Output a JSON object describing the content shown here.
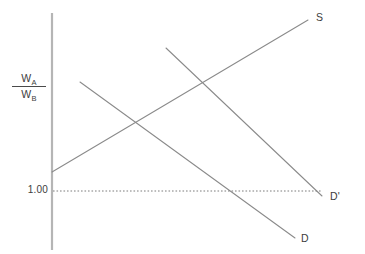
{
  "figure": {
    "type": "economics-supply-demand-diagram",
    "background_color": "#ffffff",
    "line_color": "#8a8a8a",
    "axis_color": "#b5b5b5",
    "text_color": "#3d3d3d"
  },
  "axes": {
    "y_axis": {
      "name": "relative-wage-axis",
      "label_numerator": "W",
      "label_numerator_sub": "A",
      "label_denominator": "W",
      "label_denominator_sub": "B",
      "x": 52,
      "y_top": 13,
      "y_bottom": 250
    },
    "ticks": [
      {
        "label": "1.00",
        "y": 191
      }
    ]
  },
  "reference_line": {
    "name": "unity-wage-ratio-line",
    "label": "1.00",
    "style": "dotted",
    "y": 191,
    "x_start": 53,
    "x_end": 322
  },
  "curves": [
    {
      "name": "supply-curve",
      "label": "S",
      "slope": "upward",
      "x1": 52,
      "y1": 172,
      "x2": 308,
      "y2": 20,
      "label_x": 316,
      "label_y": 11
    },
    {
      "name": "demand-curve",
      "label": "D",
      "slope": "downward",
      "x1": 80,
      "y1": 82,
      "x2": 295,
      "y2": 238,
      "label_x": 301,
      "label_y": 232
    },
    {
      "name": "demand-curve-shifted",
      "label": "D'",
      "slope": "downward",
      "x1": 166,
      "y1": 48,
      "x2": 322,
      "y2": 196,
      "label_x": 330,
      "label_y": 190
    }
  ],
  "intersections": [
    {
      "name": "equilibrium-initial",
      "curves": "S x D",
      "x": 137,
      "y": 123
    },
    {
      "name": "equilibrium-shifted",
      "curves": "S x D'",
      "x": 207,
      "y": 85
    }
  ],
  "chart_data": {
    "type": "line",
    "title": "",
    "xlabel": "",
    "ylabel": "W_A / W_B",
    "grid": false,
    "legend": "inline-endpoint-labels",
    "annotations": [
      "S",
      "D",
      "D'",
      "1.00"
    ],
    "series": [
      {
        "name": "S",
        "description": "Supply of labor in country A relative to B; upward sloping",
        "points": [
          [
            0,
            0.38
          ],
          [
            1.0,
            1.0
          ]
        ]
      },
      {
        "name": "D",
        "description": "Initial relative demand for labor; downward sloping",
        "points": [
          [
            0.11,
            0.75
          ],
          [
            0.95,
            0.11
          ]
        ]
      },
      {
        "name": "D'",
        "description": "Shifted relative demand for labor; downward sloping, to the right of D",
        "points": [
          [
            0.45,
            0.89
          ],
          [
            1.06,
            0.29
          ]
        ]
      },
      {
        "name": "1.00",
        "description": "Horizontal dotted reference line at relative wage equal to one",
        "points": [
          [
            0,
            0.31
          ],
          [
            1.06,
            0.31
          ]
        ]
      }
    ]
  }
}
